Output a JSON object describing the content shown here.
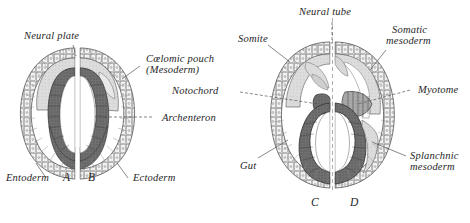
{
  "figure": {
    "background_color": "#ffffff",
    "ink_color": "#262626",
    "panels": [
      {
        "id": "A",
        "label": "A"
      },
      {
        "id": "B",
        "label": "B"
      },
      {
        "id": "C",
        "label": "C"
      },
      {
        "id": "D",
        "label": "D"
      }
    ],
    "labels": {
      "neural_plate": "Neural plate",
      "coelomic_pouch_line1": "Cœlomic pouch",
      "coelomic_pouch_line2": "(Mesoderm)",
      "archenteron": "Archenteron",
      "entoderm": "Entoderm",
      "ectoderm": "Ectoderm",
      "neural_tube": "Neural tube",
      "somite": "Somite",
      "notochord": "Notochord",
      "somatic_mesoderm_line1": "Somatic",
      "somatic_mesoderm_line2": "mesoderm",
      "myotome": "Myotome",
      "splanchnic_mesoderm_line1": "Splanchnic",
      "splanchnic_mesoderm_line2": "mesoderm",
      "gut": "Gut"
    },
    "panel_ids": {
      "a": "A",
      "b": "B",
      "c": "C",
      "d": "D"
    },
    "colors": {
      "ectoderm_fill": "#efefef",
      "ectoderm_stroke": "#6b6b6b",
      "entoderm_fill": "#6e6e6e",
      "mesoderm_fill": "#b8b8b8",
      "lumen_fill": "#ffffff",
      "outline": "#3a3a3a"
    }
  }
}
